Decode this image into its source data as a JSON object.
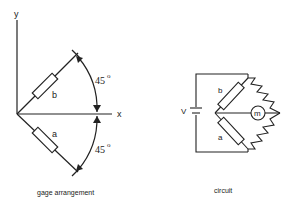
{
  "gage_arrangement": {
    "caption": "gage arrangement",
    "axis_y_label": "y",
    "axis_x_label": "x",
    "gage_b_label": "b",
    "gage_a_label": "a",
    "angle_upper": "45",
    "angle_lower": "45",
    "degree_symbol": "o"
  },
  "circuit": {
    "caption": "circuit",
    "voltage_label": "V",
    "gage_b_label": "b",
    "gage_a_label": "a",
    "meter_label": "m"
  }
}
